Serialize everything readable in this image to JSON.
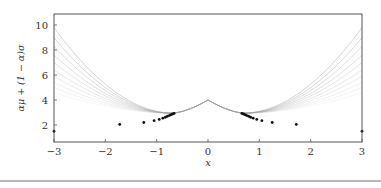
{
  "chart_data": {
    "type": "line",
    "title": "",
    "xlabel": "x",
    "ylabel": "αμ + (1 − α)σ",
    "xlim": [
      -3,
      3
    ],
    "ylim": [
      1.4,
      10.5
    ],
    "xticks": [
      -3,
      -2,
      -1,
      0,
      1,
      2,
      3
    ],
    "yticks": [
      2,
      4,
      6,
      8,
      10
    ],
    "grid": false,
    "legend": null,
    "series": [
      {
        "name": "curve-1",
        "alpha_shade": 0.55,
        "y_at_edge": 9.8
      },
      {
        "name": "curve-2",
        "alpha_shade": 0.5,
        "y_at_edge": 9.0
      },
      {
        "name": "curve-3",
        "alpha_shade": 0.45,
        "y_at_edge": 8.3
      },
      {
        "name": "curve-4",
        "alpha_shade": 0.4,
        "y_at_edge": 7.6
      },
      {
        "name": "curve-5",
        "alpha_shade": 0.35,
        "y_at_edge": 7.0
      },
      {
        "name": "curve-6",
        "alpha_shade": 0.3,
        "y_at_edge": 6.4
      },
      {
        "name": "curve-7",
        "alpha_shade": 0.25,
        "y_at_edge": 5.9
      },
      {
        "name": "curve-8",
        "alpha_shade": 0.2,
        "y_at_edge": 5.4
      },
      {
        "name": "curve-9",
        "alpha_shade": 0.15,
        "y_at_edge": 5.0
      },
      {
        "name": "curve-10",
        "alpha_shade": 0.1,
        "y_at_edge": 4.6
      }
    ],
    "center_peak": {
      "x": 0,
      "y": 4.0
    },
    "points": [
      {
        "x": -3.0,
        "y": 1.5
      },
      {
        "x": -1.72,
        "y": 2.05
      },
      {
        "x": -1.25,
        "y": 2.2
      },
      {
        "x": -1.05,
        "y": 2.35
      },
      {
        "x": -0.95,
        "y": 2.45
      },
      {
        "x": -0.88,
        "y": 2.55
      },
      {
        "x": -0.83,
        "y": 2.62
      },
      {
        "x": -0.79,
        "y": 2.7
      },
      {
        "x": -0.75,
        "y": 2.77
      },
      {
        "x": -0.72,
        "y": 2.83
      },
      {
        "x": -0.69,
        "y": 2.88
      },
      {
        "x": -0.66,
        "y": 2.93
      },
      {
        "x": 0.66,
        "y": 2.93
      },
      {
        "x": 0.69,
        "y": 2.88
      },
      {
        "x": 0.72,
        "y": 2.83
      },
      {
        "x": 0.75,
        "y": 2.77
      },
      {
        "x": 0.79,
        "y": 2.7
      },
      {
        "x": 0.83,
        "y": 2.62
      },
      {
        "x": 0.88,
        "y": 2.55
      },
      {
        "x": 0.95,
        "y": 2.45
      },
      {
        "x": 1.05,
        "y": 2.35
      },
      {
        "x": 1.25,
        "y": 2.2
      },
      {
        "x": 1.72,
        "y": 2.05
      },
      {
        "x": 3.0,
        "y": 1.5
      }
    ]
  },
  "axes": {
    "xlabel": "x",
    "ylabel": "αμ + (1 − α)σ",
    "xtick_labels": [
      "−3",
      "−2",
      "−1",
      "0",
      "1",
      "2",
      "3"
    ],
    "ytick_labels": [
      "2",
      "4",
      "6",
      "8",
      "10"
    ]
  },
  "colors": {
    "axis": "#555555",
    "curve": "#9a9a9a",
    "point": "#111111",
    "text": "#333333"
  }
}
